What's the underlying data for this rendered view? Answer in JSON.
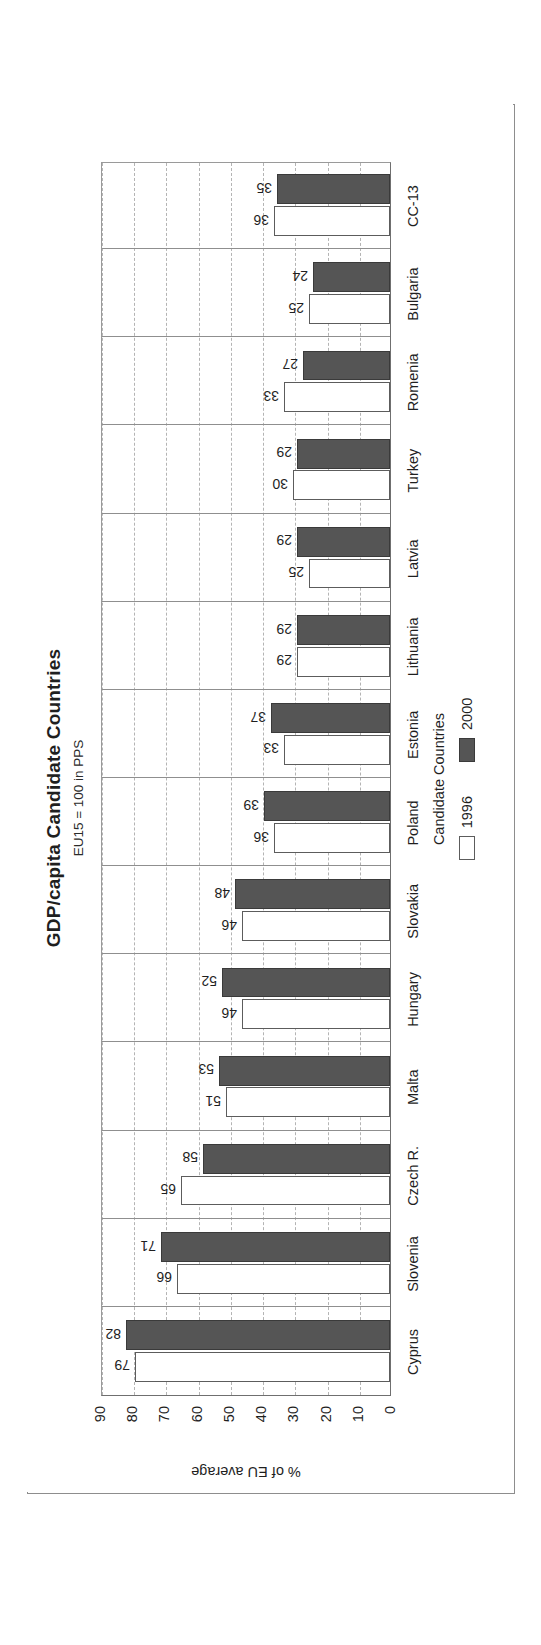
{
  "chart_data": {
    "type": "bar",
    "title": "GDP/capita Candidate Countries",
    "subtitle": "EU15 = 100 in PPS",
    "xlabel": "Candidate Countries",
    "ylabel": "% of EU average",
    "ylim": [
      0,
      90
    ],
    "yticks": [
      0,
      10,
      20,
      30,
      40,
      50,
      60,
      70,
      80,
      90
    ],
    "ytick_labels": [
      "0",
      "10",
      "20",
      "30",
      "40",
      "50",
      "60",
      "70",
      "80",
      "90"
    ],
    "grid": true,
    "legend_position": "bottom",
    "categories": [
      "Cyprus",
      "Slovenia",
      "Czech R.",
      "Malta",
      "Hungary",
      "Slovakia",
      "Poland",
      "Estonia",
      "Lithuania",
      "Latvia",
      "Turkey",
      "Romenia",
      "Bulgaria",
      "CC-13"
    ],
    "series": [
      {
        "name": "1996",
        "color": "#ffffff",
        "values": [
          79,
          66,
          65,
          51,
          46,
          46,
          36,
          33,
          29,
          25,
          30,
          33,
          25,
          36
        ]
      },
      {
        "name": "2000",
        "color": "#555555",
        "values": [
          82,
          71,
          58,
          53,
          52,
          48,
          39,
          37,
          29,
          29,
          29,
          27,
          24,
          35
        ]
      }
    ],
    "data_labels": [
      {
        "category": "Cyprus",
        "label_1996": "79",
        "label_2000": "82"
      },
      {
        "category": "Slovenia",
        "label_1996": "66",
        "label_2000": "71"
      },
      {
        "category": "Czech R.",
        "label_1996": "65",
        "label_2000": "58"
      },
      {
        "category": "Malta",
        "label_1996": "51",
        "label_2000": "53"
      },
      {
        "category": "Hungary",
        "label_1996": "46",
        "label_2000": "52"
      },
      {
        "category": "Slovakia",
        "label_1996": "46",
        "label_2000": "48"
      },
      {
        "category": "Poland",
        "label_1996": "36",
        "label_2000": "39"
      },
      {
        "category": "Estonia",
        "label_1996": "33",
        "label_2000": "37"
      },
      {
        "category": "Lithuania",
        "label_1996": "29",
        "label_2000": "29"
      },
      {
        "category": "Latvia",
        "label_1996": "25",
        "label_2000": "29"
      },
      {
        "category": "Turkey",
        "label_1996": "30",
        "label_2000": "29"
      },
      {
        "category": "Romenia",
        "label_1996": "33",
        "label_2000": "27"
      },
      {
        "category": "Bulgaria",
        "label_1996": "25",
        "label_2000": "24"
      },
      {
        "category": "CC-13",
        "label_1996": "36",
        "label_2000": "35"
      }
    ]
  },
  "legend": {
    "items": [
      {
        "label": "1996",
        "swatch": "white-square"
      },
      {
        "label": "2000",
        "swatch": "dark-square"
      }
    ]
  },
  "colors": {
    "series_1996": "#ffffff",
    "series_2000": "#555555",
    "axis": "#6f6f6f",
    "grid": "#b4b4b4",
    "text": "#1f1f1f"
  }
}
